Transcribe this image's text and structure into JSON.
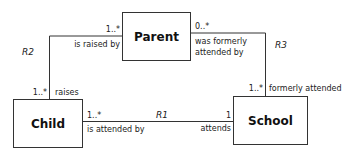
{
  "classes": {
    "parent": "Parent",
    "child": "Child",
    "school": "School"
  },
  "relationships": {
    "r1": {
      "name": "R1",
      "child_multiplicity": "1..*",
      "child_phrase": "is attended by",
      "school_multiplicity": "1",
      "school_phrase": "attends"
    },
    "r2": {
      "name": "R2",
      "parent_multiplicity": "1..*",
      "parent_phrase": "is raised by",
      "child_multiplicity": "1..*",
      "child_phrase": "raises"
    },
    "r3": {
      "name": "R3",
      "parent_multiplicity": "0..*",
      "parent_phrase_line1": "was formerly",
      "parent_phrase_line2": "attended by",
      "school_multiplicity": "1..*",
      "school_phrase": "formerly attended"
    }
  }
}
